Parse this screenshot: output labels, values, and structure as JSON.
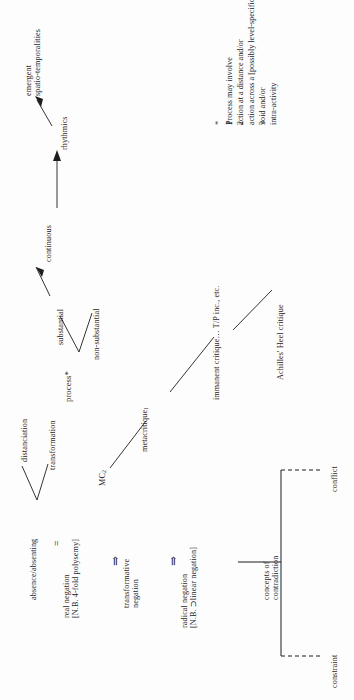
{
  "diagram": {
    "orientation": "rotated-90-ccw",
    "ink_color": "#1d1d1d",
    "background_color": "#fdfdfd"
  },
  "process_branch": {
    "root": "process*",
    "substantial": "substantial",
    "non_substantial": "non-substantial",
    "continuous": "continuous",
    "rhythmics": "rhythmics",
    "emergent": "emergent\nspatio-temporalities"
  },
  "footnote": {
    "markers": [
      "*",
      "1",
      "2",
      "3",
      "",
      ""
    ],
    "lines": [
      "Process may involve",
      "action at a distance and/or",
      "action across a [possibly level-specific]",
      "void and/or",
      "intra-activity"
    ],
    "text_block": "Process may involve\naction at a distance and/or\naction across a [possibly level-specific]\nvoid and/or\nintra-activity",
    "marker_block": "*\n1\n2\n\n3"
  },
  "negation_chain": {
    "distanciation": "distanciation",
    "transformation": "transformation",
    "absence": "absence/absenting",
    "equals": "=",
    "real_negation": "real negation\n[N.B. 4-fold polysemy]",
    "transformative_negation": "transformative\nnegation",
    "radical_negation": "radical negation\n[N.B. ⊃linear negation]",
    "arrow_glyph": "⇒"
  },
  "critique_chain": {
    "mc2": "MC",
    "mc2_sub": "2",
    "metacritique1": "metacritique",
    "metacritique1_sub": "1",
    "immanent_critique": "immanent critique",
    "immanent_tail": "… T/P inc., etc.",
    "achilles": "Achilles' Heel critique"
  },
  "contradiction_bracket": {
    "center": "concepts of\ncontradiction",
    "top_branch": "conflict",
    "bottom_branch": "constraint"
  }
}
